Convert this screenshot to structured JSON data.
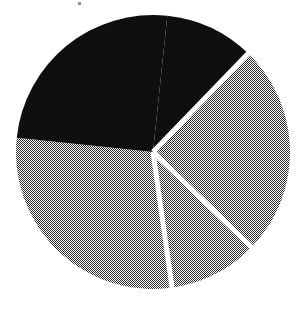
{
  "figure": {
    "title": "",
    "background_color": "#ffffff",
    "width": 305,
    "height": 310,
    "artifact_label": "scan-speck"
  },
  "chart_data": {
    "type": "pie",
    "title": "",
    "xlabel": "",
    "ylabel": "",
    "legend": "none",
    "grid": false,
    "start_angle_deg": 44,
    "direction": "clockwise",
    "center": {
      "x": 153,
      "y": 152
    },
    "radius": 137,
    "separator_color": "#ffffff",
    "separator_width": 5,
    "categories": [
      "Slice 1",
      "Slice 2",
      "Slice 3"
    ],
    "values": [
      64.4,
      25.0,
      10.6
    ],
    "angles_deg": [
      232,
      90,
      38
    ],
    "boundary_angles_deg": [
      44,
      134,
      172
    ],
    "colors": [
      "#808080",
      "#111111",
      "#111111"
    ],
    "fill_styles": [
      "dither-50-gray",
      "solid-black",
      "solid-black"
    ],
    "slices": [
      {
        "name": "Slice 1",
        "value": 64.4,
        "angle_deg": 232,
        "start_deg": 172,
        "end_deg": 44,
        "color": "#808080",
        "fill_style": "dither-50-gray"
      },
      {
        "name": "Slice 2",
        "value": 25.0,
        "angle_deg": 90,
        "start_deg": 44,
        "end_deg": 134,
        "color": "#111111",
        "fill_style": "solid-black"
      },
      {
        "name": "Slice 3",
        "value": 10.6,
        "angle_deg": 38,
        "start_deg": 134,
        "end_deg": 172,
        "color": "#111111",
        "fill_style": "solid-black"
      }
    ]
  }
}
